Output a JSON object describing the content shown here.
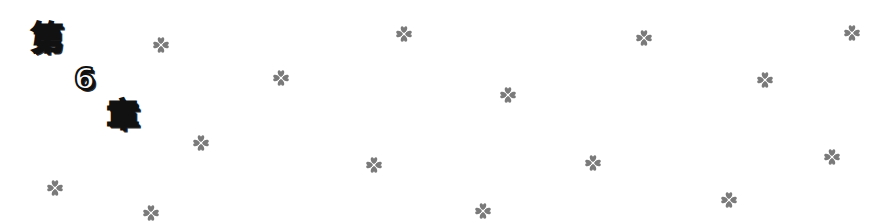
{
  "title": {
    "chars": [
      "第",
      "6",
      "章"
    ],
    "text": "第6章"
  },
  "decoration": {
    "icon": "four-leaf-clover-icon",
    "color": "#7a7a7a",
    "positions": [
      [
        161,
        45
      ],
      [
        281,
        78
      ],
      [
        404,
        34
      ],
      [
        644,
        38
      ],
      [
        852,
        33
      ],
      [
        508,
        95
      ],
      [
        765,
        80
      ],
      [
        201,
        143
      ],
      [
        374,
        165
      ],
      [
        593,
        163
      ],
      [
        832,
        157
      ],
      [
        55,
        188
      ],
      [
        151,
        213
      ],
      [
        483,
        211
      ],
      [
        729,
        200
      ]
    ]
  }
}
